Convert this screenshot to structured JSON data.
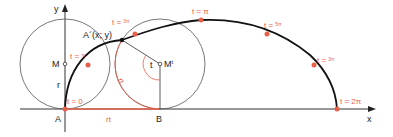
{
  "diagram": {
    "axes": {
      "x_label": "x",
      "y_label": "y"
    },
    "points": {
      "A": "A",
      "B": "B",
      "M": "M",
      "Mt": "M",
      "Mt_sup": "t",
      "A_prime": "A´(x; y)"
    },
    "segment_labels": {
      "radius": "r",
      "arc": "rt",
      "base": "rt",
      "angle": "t"
    },
    "parameter_labels": [
      {
        "text": "t = 0",
        "num": "",
        "den": ""
      },
      {
        "text": "t = ",
        "num": "π",
        "den": "2"
      },
      {
        "text": "t = ",
        "num": "3π",
        "den": "4"
      },
      {
        "text": "t = π",
        "num": "",
        "den": ""
      },
      {
        "text": "t = ",
        "num": "5π",
        "den": "4"
      },
      {
        "text": "t = ",
        "num": "3π",
        "den": "2"
      },
      {
        "text": "t = 2π",
        "num": "",
        "den": ""
      }
    ],
    "colors": {
      "curve": "#111111",
      "accent": "#e8604a",
      "circle": "#555555",
      "axis": "#333333"
    }
  }
}
